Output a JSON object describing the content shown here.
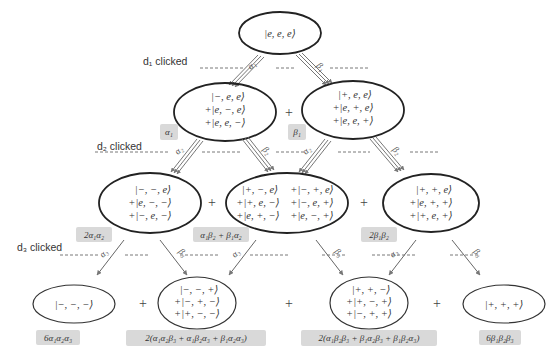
{
  "levels": {
    "d1_label": "d₁ clicked",
    "d2_label": "d₂ clicked",
    "d3_label": "d₃ clicked"
  },
  "root": {
    "lines": [
      "|e, e, e⟩"
    ]
  },
  "level1": {
    "left": {
      "lines": [
        "|−, e, e⟩",
        "+|e, −, e⟩",
        "+|e, e, −⟩"
      ],
      "coef": "α₁"
    },
    "right": {
      "lines": [
        "|+, e, e⟩",
        "+|e, +, e⟩",
        "+|e, e, +⟩"
      ],
      "coef": "β₁"
    },
    "plus": "+",
    "arrow_left_label": "α₁",
    "arrow_right_label": "β₁"
  },
  "level2": {
    "left": {
      "lines": [
        "|−, −, e⟩",
        "+|e, −, −⟩",
        "+|−, e, −⟩"
      ],
      "coef": "2α₁α₂"
    },
    "middle": {
      "col1": [
        "|+, −, e⟩",
        "+|+, e, −⟩",
        "+|e, +, −⟩"
      ],
      "col2": [
        "+|−, +, e⟩",
        "+|−, e, +⟩",
        "+|e, −, +⟩"
      ],
      "coef": "α₁β₂ + β₁α₂"
    },
    "right": {
      "lines": [
        "|+, +, e⟩",
        "+|e, +, +⟩",
        "+|+, e, +⟩"
      ],
      "coef": "2β₁β₂"
    },
    "plus": "+",
    "arrow_alpha_label": "α₂",
    "arrow_beta_label": "β₂"
  },
  "level3": {
    "n1": {
      "lines": [
        "|−, −, −⟩"
      ],
      "coef": "6α₁α₂α₃"
    },
    "n2": {
      "lines": [
        "|−, −, +⟩",
        "+|−, +, −⟩",
        "+|+, −, −⟩"
      ],
      "coef": "2(α₁α₂β₃ + α₁β₂α₃ + β₁α₂α₃)"
    },
    "n3": {
      "lines": [
        "|+, +, −⟩",
        "+|+, −, +⟩",
        "+|−, +, +⟩"
      ],
      "coef": "2(α₁β₂β₃ + β₁α₂β₃ + β₁β₂α₃)"
    },
    "n4": {
      "lines": [
        "|+, +, +⟩"
      ],
      "coef": "6β₁β₂β₃"
    },
    "plus": "+",
    "arrow_alpha_label": "α₃",
    "arrow_beta_label": "β₃"
  },
  "colors": {
    "ellipse_stroke": "#222222",
    "coef_bg": "#d9d9d9",
    "arrow": "#666666",
    "dash": "#555555"
  }
}
